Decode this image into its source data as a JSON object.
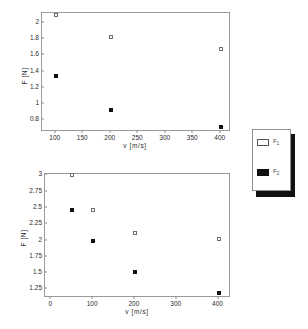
{
  "chart_data": [
    {
      "type": "scatter",
      "id": "top-chart",
      "title": "",
      "xlabel": "v [m/s]",
      "ylabel": "F [N]",
      "xlim": [
        75,
        415
      ],
      "ylim": [
        0.68,
        2.12
      ],
      "xticks": [
        100,
        150,
        200,
        250,
        300,
        350,
        400
      ],
      "yticks": [
        0.8,
        1,
        1.2,
        1.4,
        1.6,
        1.8,
        2
      ],
      "xtick_labels": [
        "100",
        "150",
        "200",
        "250",
        "300",
        "350",
        "400"
      ],
      "ytick_labels": [
        "0.8",
        "1",
        "1.2",
        "1.4",
        "1.6",
        "1.8",
        "2"
      ],
      "grid": false,
      "legend_position": "right-outside",
      "series": [
        {
          "name": "F1",
          "marker": "open-square",
          "x": [
            100,
            200,
            400
          ],
          "y": [
            2.1,
            1.82,
            1.68
          ]
        },
        {
          "name": "F2",
          "marker": "filled-square",
          "x": [
            100,
            200,
            400
          ],
          "y": [
            1.35,
            0.93,
            0.72
          ]
        }
      ]
    },
    {
      "type": "scatter",
      "id": "bottom-chart",
      "title": "",
      "xlabel": "v [m/s]",
      "ylabel": "F [N]",
      "xlim": [
        -15,
        425
      ],
      "ylim": [
        1.15,
        3.02
      ],
      "xticks": [
        0,
        100,
        200,
        300,
        400
      ],
      "yticks": [
        1.25,
        1.5,
        1.75,
        2,
        2.25,
        2.5,
        2.75,
        3
      ],
      "xtick_labels": [
        "0",
        "100",
        "200",
        "300",
        "400"
      ],
      "ytick_labels": [
        "1.25",
        "1.5",
        "1.75",
        "2",
        "2.25",
        "2.5",
        "2.75",
        "3"
      ],
      "grid": false,
      "legend_position": "right-outside",
      "series": [
        {
          "name": "F1",
          "marker": "open-square",
          "x": [
            50,
            100,
            200,
            400
          ],
          "y": [
            3.0,
            2.47,
            2.12,
            2.02
          ]
        },
        {
          "name": "F2",
          "marker": "filled-square",
          "x": [
            50,
            100,
            200,
            400
          ],
          "y": [
            2.47,
            2.0,
            1.52,
            1.2
          ]
        }
      ]
    }
  ],
  "legend": {
    "entries": [
      {
        "label": "F",
        "sub": "1",
        "marker": "open-square"
      },
      {
        "label": "F",
        "sub": "2",
        "marker": "filled-square"
      }
    ]
  }
}
